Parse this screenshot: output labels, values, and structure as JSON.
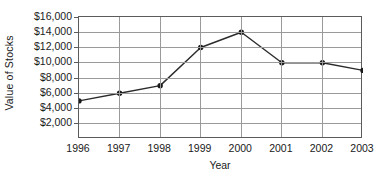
{
  "chart_data": {
    "type": "line",
    "title": "",
    "xlabel": "Year",
    "ylabel": "Value of Stocks",
    "categories": [
      "1996",
      "1997",
      "1998",
      "1999",
      "2000",
      "2001",
      "2002",
      "2003"
    ],
    "values": [
      5000,
      6000,
      7000,
      12000,
      14000,
      10000,
      10000,
      9000
    ],
    "series": [
      {
        "name": "Value of Stocks",
        "values": [
          5000,
          6000,
          7000,
          12000,
          14000,
          10000,
          10000,
          9000
        ]
      }
    ],
    "ylim": [
      0,
      16000
    ],
    "ytick_values": [
      2000,
      4000,
      6000,
      8000,
      10000,
      12000,
      14000,
      16000
    ],
    "ytick_labels": [
      "$2,000",
      "$4,000",
      "$6,000",
      "$8,000",
      "$10,000",
      "$12,000",
      "$14,000",
      "$16,000"
    ],
    "xtick_labels": [
      "1996",
      "1997",
      "1998",
      "1999",
      "2000",
      "2001",
      "2002",
      "2003"
    ],
    "grid": "both",
    "legend": "none",
    "marker": "filled-circle",
    "line_color": "#2b2b2b",
    "marker_color": "#1a1a1a",
    "grid_color": "#9a9a9a",
    "frame_color": "#5b5b5b",
    "background_color": "#ffffff"
  }
}
